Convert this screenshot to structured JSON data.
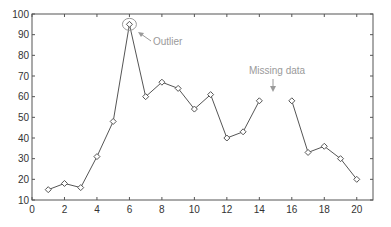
{
  "chart_data": {
    "type": "line",
    "title": "",
    "xlabel": "",
    "ylabel": "",
    "xlim": [
      0,
      21
    ],
    "ylim": [
      10,
      100
    ],
    "grid": false,
    "legend": null,
    "x_ticks": [
      0,
      2,
      4,
      6,
      8,
      10,
      12,
      14,
      16,
      18,
      20
    ],
    "y_ticks": [
      10,
      20,
      30,
      40,
      50,
      60,
      70,
      80,
      90,
      100
    ],
    "series": [
      {
        "name": "data",
        "marker": "diamond",
        "color": "#555555",
        "x": [
          1,
          2,
          3,
          4,
          5,
          6,
          7,
          8,
          9,
          10,
          11,
          12,
          13,
          14,
          15,
          16,
          17,
          18,
          19,
          20
        ],
        "values": [
          15,
          18,
          16,
          31,
          48,
          95,
          60,
          67,
          64,
          54,
          61,
          40,
          43,
          58,
          null,
          58,
          33,
          36,
          30,
          20
        ]
      }
    ],
    "annotations": [
      {
        "text": "Outlier",
        "target": [
          6,
          95
        ],
        "style": "circle-and-arrow"
      },
      {
        "text": "Missing data",
        "target": [
          15,
          null
        ],
        "style": "down-arrow"
      }
    ]
  },
  "labels": {
    "outlier": "Outlier",
    "missing": "Missing data"
  }
}
